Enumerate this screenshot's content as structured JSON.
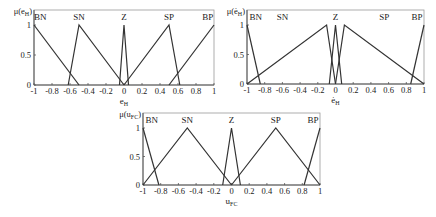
{
  "chart_data": [
    {
      "type": "line",
      "title": "",
      "xlabel": "e_H",
      "ylabel": "μ(e_H)",
      "xlim": [
        -1,
        1
      ],
      "ylim": [
        0,
        1
      ],
      "xticks": [
        "-1",
        "-0.8",
        "-0.6",
        "-0.4",
        "-0.2",
        "0",
        "0.2",
        "0.4",
        "0.6",
        "0.8",
        "1"
      ],
      "yticks": [
        "0",
        "0.5",
        "1"
      ],
      "grid": false,
      "series": [
        {
          "name": "BN",
          "points": [
            [
              -1,
              1
            ],
            [
              -0.5,
              0
            ]
          ]
        },
        {
          "name": "SN",
          "points": [
            [
              -0.62,
              0
            ],
            [
              -0.5,
              1
            ],
            [
              0,
              0
            ]
          ]
        },
        {
          "name": "Z",
          "points": [
            [
              -0.05,
              0
            ],
            [
              0,
              1
            ],
            [
              0.05,
              0
            ]
          ]
        },
        {
          "name": "SP",
          "points": [
            [
              0,
              0
            ],
            [
              0.5,
              1
            ],
            [
              0.62,
              0
            ]
          ]
        },
        {
          "name": "BP",
          "points": [
            [
              0.5,
              0
            ],
            [
              1,
              1
            ]
          ]
        }
      ],
      "labels": [
        {
          "text": "BN",
          "x": -0.93
        },
        {
          "text": "SN",
          "x": -0.5
        },
        {
          "text": "Z",
          "x": 0
        },
        {
          "text": "SP",
          "x": 0.5
        },
        {
          "text": "BP",
          "x": 0.93
        }
      ]
    },
    {
      "type": "line",
      "title": "",
      "xlabel": "ė_H",
      "ylabel": "μ(ė_H)",
      "xlim": [
        -1,
        1
      ],
      "ylim": [
        0,
        1
      ],
      "xticks": [
        "-1",
        "-0.8",
        "-0.6",
        "-0.4",
        "-0.2",
        "0",
        "0.2",
        "0.4",
        "0.6",
        "0.8",
        "1"
      ],
      "yticks": [
        "0",
        "0.5",
        "1"
      ],
      "grid": false,
      "series": [
        {
          "name": "BN",
          "points": [
            [
              -1,
              1
            ],
            [
              -0.85,
              0
            ]
          ]
        },
        {
          "name": "SN",
          "points": [
            [
              -1,
              0
            ],
            [
              -0.1,
              1
            ],
            [
              0,
              0
            ]
          ]
        },
        {
          "name": "Z",
          "points": [
            [
              -0.07,
              0
            ],
            [
              0,
              1
            ],
            [
              0.07,
              0
            ]
          ]
        },
        {
          "name": "SP",
          "points": [
            [
              0,
              0
            ],
            [
              0.1,
              1
            ],
            [
              1,
              0
            ]
          ]
        },
        {
          "name": "BP",
          "points": [
            [
              0.85,
              0
            ],
            [
              1,
              1
            ]
          ]
        }
      ],
      "labels": [
        {
          "text": "BN",
          "x": -0.9
        },
        {
          "text": "SN",
          "x": -0.6
        },
        {
          "text": "Z",
          "x": 0
        },
        {
          "text": "SP",
          "x": 0.55
        },
        {
          "text": "BP",
          "x": 0.92
        }
      ]
    },
    {
      "type": "line",
      "title": "",
      "xlabel": "u_FC",
      "ylabel": "μ(u_FC)",
      "xlim": [
        -1,
        1
      ],
      "ylim": [
        0,
        1
      ],
      "xticks": [
        "-1",
        "-0.8",
        "-0.6",
        "-0.4",
        "-0.2",
        "0",
        "0.2",
        "0.4",
        "0.6",
        "0.8",
        "1"
      ],
      "yticks": [
        "0",
        "0.5",
        "1"
      ],
      "grid": false,
      "series": [
        {
          "name": "BN",
          "points": [
            [
              -1,
              1
            ],
            [
              -0.82,
              0
            ]
          ]
        },
        {
          "name": "SN",
          "points": [
            [
              -1,
              0
            ],
            [
              -0.5,
              1
            ],
            [
              0,
              0
            ]
          ]
        },
        {
          "name": "Z",
          "points": [
            [
              -0.1,
              0
            ],
            [
              0,
              1
            ],
            [
              0.1,
              0
            ]
          ]
        },
        {
          "name": "SP",
          "points": [
            [
              0,
              0
            ],
            [
              0.5,
              1
            ],
            [
              1,
              0
            ]
          ]
        },
        {
          "name": "BP",
          "points": [
            [
              0.82,
              0
            ],
            [
              1,
              1
            ]
          ]
        }
      ],
      "labels": [
        {
          "text": "BN",
          "x": -0.9
        },
        {
          "text": "SN",
          "x": -0.5
        },
        {
          "text": "Z",
          "x": 0
        },
        {
          "text": "SP",
          "x": 0.5
        },
        {
          "text": "BP",
          "x": 0.92
        }
      ]
    }
  ],
  "layout": [
    {
      "left": 34,
      "top": 10,
      "right": 214,
      "bottom": 85
    },
    {
      "left": 247,
      "top": 10,
      "right": 424,
      "bottom": 84
    },
    {
      "left": 143,
      "top": 113,
      "right": 320,
      "bottom": 185
    }
  ],
  "ylabels_display": [
    {
      "base": "μ(e",
      "sub": "H",
      "tail": ")"
    },
    {
      "base": "μ(ė",
      "sub": "H",
      "tail": ")"
    },
    {
      "base": "μ(u",
      "sub": "FC",
      "tail": ")"
    }
  ],
  "xlabels_display": [
    {
      "base": "e",
      "sub": "H"
    },
    {
      "base": "ė",
      "sub": "H"
    },
    {
      "base": "u",
      "sub": "FC"
    }
  ],
  "colors": {
    "line": "#333333",
    "axis": "#555555",
    "frame": "#999999"
  }
}
